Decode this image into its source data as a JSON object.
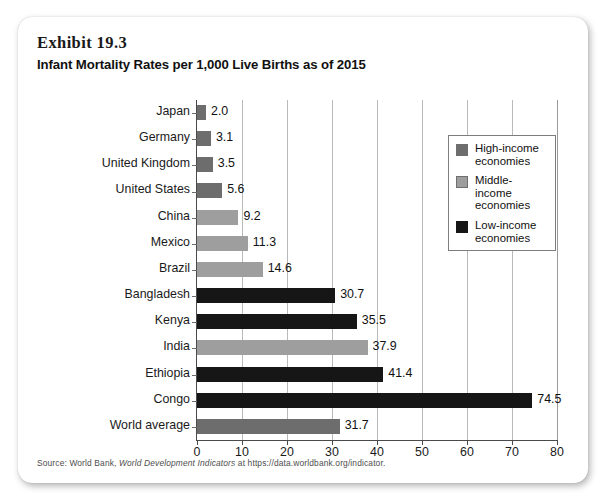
{
  "exhibit": {
    "number": "Exhibit 19.3",
    "title": "Infant Mortality Rates per 1,000 Live Births as of 2015"
  },
  "source": {
    "prefix": "Source: World Bank, ",
    "publication": "World Development Indicators",
    "suffix": " at https://data.worldbank.org/indicator."
  },
  "legend": {
    "items": [
      {
        "label": "High-income economies",
        "group": "high",
        "color": "#6d6d6d"
      },
      {
        "label": "Middle-income economies",
        "group": "middle",
        "color": "#9e9e9e"
      },
      {
        "label": "Low-income economies",
        "group": "low",
        "color": "#161616"
      }
    ]
  },
  "chart_data": {
    "type": "bar",
    "orientation": "horizontal",
    "title": "Infant Mortality Rates per 1,000 Live Births as of 2015",
    "xlabel": "",
    "ylabel": "",
    "xlim": [
      0,
      80
    ],
    "xticks": [
      0,
      10,
      20,
      30,
      40,
      50,
      60,
      70,
      80
    ],
    "grid": "vertical",
    "legend_position": "top-right-inside",
    "categories": [
      "Japan",
      "Germany",
      "United Kingdom",
      "United States",
      "China",
      "Mexico",
      "Brazil",
      "Bangladesh",
      "Kenya",
      "India",
      "Ethiopia",
      "Congo",
      "World average"
    ],
    "values": [
      2.0,
      3.1,
      3.5,
      5.6,
      9.2,
      11.3,
      14.6,
      30.7,
      35.5,
      37.9,
      41.4,
      74.5,
      31.7
    ],
    "value_labels": [
      "2.0",
      "3.1",
      "3.5",
      "5.6",
      "9.2",
      "11.3",
      "14.6",
      "30.7",
      "35.5",
      "37.9",
      "41.4",
      "74.5",
      "31.7"
    ],
    "groups": [
      "high",
      "high",
      "high",
      "high",
      "middle",
      "middle",
      "middle",
      "low",
      "low",
      "middle",
      "low",
      "low",
      "high"
    ],
    "series": [
      {
        "name": "High-income economies",
        "color": "#6d6d6d",
        "points": [
          {
            "category": "Japan",
            "value": 2.0
          },
          {
            "category": "Germany",
            "value": 3.1
          },
          {
            "category": "United Kingdom",
            "value": 3.5
          },
          {
            "category": "United States",
            "value": 5.6
          },
          {
            "category": "World average",
            "value": 31.7
          }
        ]
      },
      {
        "name": "Middle-income economies",
        "color": "#9e9e9e",
        "points": [
          {
            "category": "China",
            "value": 9.2
          },
          {
            "category": "Mexico",
            "value": 11.3
          },
          {
            "category": "Brazil",
            "value": 14.6
          },
          {
            "category": "India",
            "value": 37.9
          }
        ]
      },
      {
        "name": "Low-income economies",
        "color": "#161616",
        "points": [
          {
            "category": "Bangladesh",
            "value": 30.7
          },
          {
            "category": "Kenya",
            "value": 35.5
          },
          {
            "category": "Ethiopia",
            "value": 41.4
          },
          {
            "category": "Congo",
            "value": 74.5
          }
        ]
      }
    ]
  }
}
